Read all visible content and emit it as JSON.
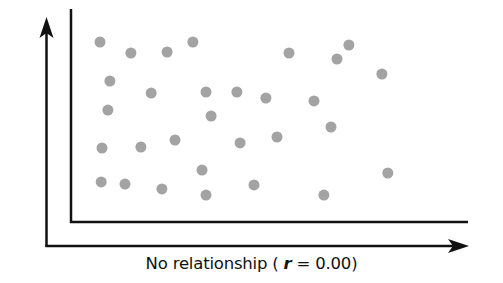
{
  "chart_data": {
    "type": "scatter",
    "title": "",
    "xlabel": "No relationship ( r = 0.00)",
    "ylabel": "",
    "caption": {
      "prefix": "No relationship ( ",
      "r_symbol": "r",
      "suffix": " = 0.00)"
    },
    "correlation_r": 0.0,
    "grid": false,
    "legend": null,
    "axis_ticks": "none",
    "xlim": [
      0,
      100
    ],
    "ylim": [
      0,
      100
    ],
    "point_color": "#a3a3a3",
    "point_radius": 5.5,
    "axis_color": "#111111",
    "plot_px": {
      "left": 71,
      "right": 468,
      "top": 10,
      "bottom": 222
    },
    "points_px": [
      [
        100,
        42
      ],
      [
        131,
        53
      ],
      [
        167,
        52
      ],
      [
        193,
        42
      ],
      [
        110,
        81
      ],
      [
        151,
        93
      ],
      [
        206,
        92
      ],
      [
        237,
        92
      ],
      [
        108,
        110
      ],
      [
        211,
        116
      ],
      [
        289,
        52
      ],
      [
        349,
        44
      ],
      [
        337,
        58
      ],
      [
        382,
        74
      ],
      [
        270,
        98
      ],
      [
        314,
        101
      ],
      [
        331,
        127
      ],
      [
        277,
        137
      ],
      [
        102,
        148
      ],
      [
        141,
        147
      ],
      [
        175,
        140
      ],
      [
        240,
        143
      ],
      [
        202,
        170
      ],
      [
        101,
        182
      ],
      [
        125,
        184
      ],
      [
        162,
        189
      ],
      [
        206,
        195
      ],
      [
        254,
        185
      ],
      [
        388,
        173
      ],
      [
        324,
        195
      ]
    ],
    "points": [
      {
        "x": 7.3,
        "y": 84.9
      },
      {
        "x": 15.1,
        "y": 79.7
      },
      {
        "x": 24.2,
        "y": 80.2
      },
      {
        "x": 30.7,
        "y": 84.9
      },
      {
        "x": 9.8,
        "y": 66.5
      },
      {
        "x": 20.2,
        "y": 60.8
      },
      {
        "x": 34.0,
        "y": 61.3
      },
      {
        "x": 41.8,
        "y": 61.3
      },
      {
        "x": 9.3,
        "y": 52.8
      },
      {
        "x": 35.3,
        "y": 50.0
      },
      {
        "x": 54.9,
        "y": 79.7
      },
      {
        "x": 70.0,
        "y": 83.5
      },
      {
        "x": 67.0,
        "y": 76.9
      },
      {
        "x": 78.3,
        "y": 69.8
      },
      {
        "x": 49.1,
        "y": 58.5
      },
      {
        "x": 61.2,
        "y": 57.1
      },
      {
        "x": 65.5,
        "y": 44.8
      },
      {
        "x": 51.9,
        "y": 40.1
      },
      {
        "x": 7.8,
        "y": 34.9
      },
      {
        "x": 17.6,
        "y": 35.4
      },
      {
        "x": 26.2,
        "y": 38.7
      },
      {
        "x": 42.6,
        "y": 37.3
      },
      {
        "x": 33.0,
        "y": 24.5
      },
      {
        "x": 7.6,
        "y": 18.9
      },
      {
        "x": 13.6,
        "y": 17.9
      },
      {
        "x": 22.9,
        "y": 15.6
      },
      {
        "x": 34.0,
        "y": 12.7
      },
      {
        "x": 46.1,
        "y": 17.5
      },
      {
        "x": 79.8,
        "y": 23.1
      },
      {
        "x": 63.7,
        "y": 12.7
      }
    ]
  }
}
